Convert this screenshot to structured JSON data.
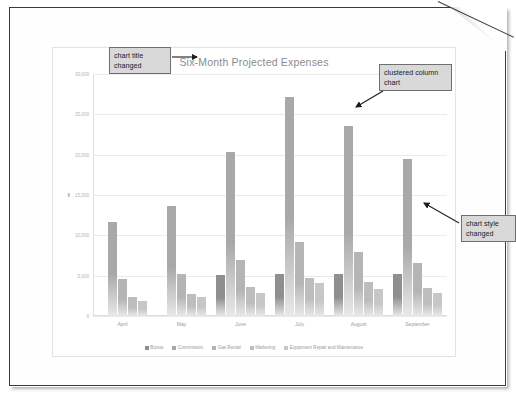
{
  "document": {
    "name": "worksheet-page",
    "folded_corner": true
  },
  "chart_data": {
    "type": "bar",
    "title": "Six-Month Projected Expenses",
    "xlabel": "",
    "ylabel": "",
    "ylim": [
      0,
      30000
    ],
    "yticks": [
      "0",
      "5,000",
      "10,000",
      "15,000",
      "20,000",
      "25,000",
      "30,000"
    ],
    "ytick_values": [
      0,
      5000,
      10000,
      15000,
      20000,
      25000,
      30000
    ],
    "selected_tick": "15,000",
    "grid": true,
    "legend_position": "bottom",
    "categories": [
      "April",
      "May",
      "June",
      "July",
      "August",
      "September"
    ],
    "series": [
      {
        "name": "Bonus",
        "color": "#8f8f8f",
        "values": [
          0,
          0,
          5100,
          5150,
          5180,
          5200
        ]
      },
      {
        "name": "Commission",
        "color": "#a8a8a8",
        "values": [
          11700,
          13600,
          20300,
          27100,
          23500,
          19500
        ]
      },
      {
        "name": "Gas Rental",
        "color": "#b5b5b5",
        "values": [
          4600,
          5250,
          6950,
          9200,
          7950,
          6600
        ]
      },
      {
        "name": "Marketing",
        "color": "#bdbdbd",
        "values": [
          2350,
          2750,
          3550,
          4750,
          4200,
          3450
        ]
      },
      {
        "name": "Equipment Repair and Maintenance",
        "color": "#c7c7c7",
        "values": [
          1800,
          2300,
          2850,
          4050,
          3300,
          2900
        ]
      }
    ]
  },
  "callouts": {
    "title_changed": "chart title changed",
    "clustered_column": "clustered column chart",
    "style_changed": "chart style changed"
  },
  "colors": {
    "callout_fill": "#d9d9d9",
    "callout_border": "#6f6f6f",
    "grid": "#eaeaea",
    "title_text": "#8b8b8b",
    "tick_text": "#b3b3b3"
  }
}
